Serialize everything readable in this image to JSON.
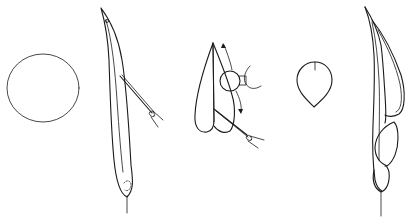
{
  "diagram": {
    "panels": [
      {
        "id": "disc",
        "shape": "circle",
        "center": [
          43,
          88
        ],
        "radius": 36
      },
      {
        "id": "elongated-leaf-with-needle",
        "shape": "long curved blade with inserted needle/probe",
        "tip": [
          101,
          8
        ],
        "base": [
          127,
          210
        ]
      },
      {
        "id": "folded-leaf-with-roller",
        "shape": "folded blade with circular roller, bidirectional arrows and needle",
        "apex": [
          213,
          43
        ]
      },
      {
        "id": "small-petal",
        "shape": "ovate petal with short midline",
        "center": [
          316,
          78
        ]
      },
      {
        "id": "assembled-structure",
        "shape": "curved stem with wrapped blades and bud",
        "tip": [
          365,
          7
        ],
        "base": [
          380,
          215
        ]
      }
    ],
    "stroke_color": "#1a1a1a",
    "background_color": "#ffffff"
  }
}
